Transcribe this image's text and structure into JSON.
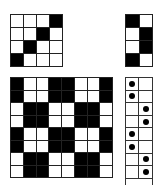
{
  "figure": {
    "top_left_grid": {
      "rows": 4,
      "cols": 4,
      "cells": [
        [
          0,
          0,
          0,
          1
        ],
        [
          0,
          0,
          1,
          0
        ],
        [
          0,
          1,
          0,
          0
        ],
        [
          1,
          0,
          0,
          0
        ]
      ]
    },
    "top_right_grid": {
      "rows": 4,
      "cols": 2,
      "cells": [
        [
          1,
          0
        ],
        [
          0,
          1
        ],
        [
          0,
          1
        ],
        [
          1,
          0
        ]
      ]
    },
    "bottom_left_grid": {
      "rows": 8,
      "cols": 8,
      "cells": [
        [
          1,
          0,
          0,
          1,
          1,
          0,
          0,
          1
        ],
        [
          1,
          0,
          0,
          1,
          1,
          0,
          0,
          1
        ],
        [
          0,
          1,
          1,
          0,
          0,
          1,
          1,
          0
        ],
        [
          0,
          1,
          1,
          0,
          0,
          1,
          1,
          0
        ],
        [
          1,
          0,
          0,
          1,
          1,
          0,
          0,
          1
        ],
        [
          1,
          0,
          0,
          1,
          1,
          0,
          0,
          1
        ],
        [
          0,
          1,
          1,
          0,
          0,
          1,
          1,
          0
        ],
        [
          0,
          1,
          1,
          0,
          0,
          1,
          1,
          0
        ]
      ]
    },
    "bottom_right_dot_grid": {
      "rows": 8,
      "cols": 2,
      "dots": [
        [
          1,
          0
        ],
        [
          1,
          0
        ],
        [
          0,
          1
        ],
        [
          0,
          1
        ],
        [
          1,
          0
        ],
        [
          1,
          0
        ],
        [
          0,
          1
        ],
        [
          0,
          1
        ]
      ]
    },
    "colors": {
      "filled": "#000000",
      "empty": "#ffffff",
      "line": "#222222"
    }
  }
}
